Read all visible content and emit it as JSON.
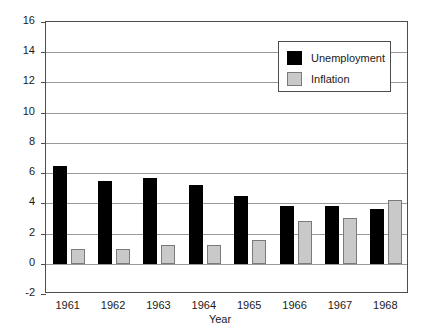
{
  "chart_data": {
    "type": "bar",
    "title": "",
    "xlabel": "Year",
    "ylabel": "Percentage",
    "categories": [
      "1961",
      "1962",
      "1963",
      "1964",
      "1965",
      "1966",
      "1967",
      "1968"
    ],
    "series": [
      {
        "name": "Unemployment",
        "color": "#000000",
        "values": [
          6.5,
          5.5,
          5.7,
          5.2,
          4.5,
          3.8,
          3.8,
          3.6
        ]
      },
      {
        "name": "Inflation",
        "color": "#c9c9c9",
        "values": [
          1.0,
          1.0,
          1.25,
          1.25,
          1.6,
          2.85,
          3.05,
          4.2
        ]
      }
    ],
    "ylim": [
      -2,
      16
    ],
    "ytick_labels": [
      "16",
      "14",
      "12",
      "10",
      "8",
      "6",
      "4",
      "2",
      "0",
      "-2"
    ],
    "ytick_values": [
      16,
      14,
      12,
      10,
      8,
      6,
      4,
      2,
      0,
      -2
    ],
    "grid": true,
    "legend_position": "top-right",
    "legend_entries": [
      "Unemployment",
      "Inflation"
    ]
  }
}
